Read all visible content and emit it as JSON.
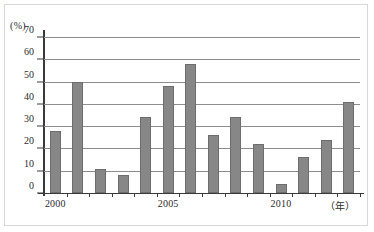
{
  "chart_data": {
    "type": "bar",
    "title": "",
    "subtitle": "",
    "xlabel": "(年)",
    "ylabel": "(%)",
    "ylim": [
      0,
      70
    ],
    "yticks": [
      0,
      10,
      20,
      30,
      40,
      50,
      60,
      70
    ],
    "ytick_labels": [
      "0",
      "10",
      "20",
      "30",
      "40",
      "50",
      "60",
      "70"
    ],
    "grid": true,
    "legend": "none",
    "categories": [
      "2000",
      "2001",
      "2002",
      "2003",
      "2004",
      "2005",
      "2006",
      "2007",
      "2008",
      "2009",
      "2010",
      "2011",
      "2012",
      "2013"
    ],
    "values": [
      28,
      50,
      11,
      8,
      34,
      48,
      58,
      26,
      34,
      22,
      4,
      16,
      24,
      41
    ],
    "visible_xtick_labels": [
      {
        "category": "2000",
        "label": "2000"
      },
      {
        "category": "2005",
        "label": "2005"
      },
      {
        "category": "2010",
        "label": "2010"
      }
    ],
    "bar_color": "#878787",
    "bar_border_color": "#6d6d6d",
    "axis_color": "#3a3a3a",
    "grid_color": "#8d8d8d",
    "background_color": "#ffffff"
  }
}
